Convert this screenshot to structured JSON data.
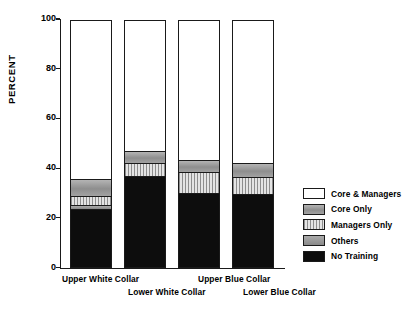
{
  "chart_data": {
    "type": "bar",
    "subtype": "stacked-bar-100-percent",
    "title": "",
    "xlabel": "",
    "ylabel": "PERCENT",
    "ylim": [
      0,
      100
    ],
    "yticks": [
      0,
      20,
      40,
      60,
      80,
      100
    ],
    "ytick_labels": [
      "0",
      "20",
      "40",
      "60",
      "80",
      "100"
    ],
    "grid": false,
    "legend_position": "right",
    "categories": [
      "Upper White Collar",
      "Lower White Collar",
      "Upper Blue Collar",
      "Lower Blue Collar"
    ],
    "series": [
      {
        "name": "No Training",
        "color": "#0d0d0d",
        "pattern": "solid-black",
        "values": [
          23.5,
          37.0,
          30.0,
          29.5
        ]
      },
      {
        "name": "Others",
        "color": "#9c9c9c",
        "pattern": "solid-gray",
        "values": [
          1.5,
          0.0,
          0.0,
          0.0
        ]
      },
      {
        "name": "Managers Only",
        "color": "#bdbdbd",
        "pattern": "vertical-stripes",
        "values": [
          4.0,
          5.0,
          8.5,
          7.0
        ]
      },
      {
        "name": "Core Only",
        "color": "#9c9c9c",
        "pattern": "solid-gray",
        "values": [
          6.5,
          5.0,
          5.0,
          5.5
        ]
      },
      {
        "name": "Core & Managers",
        "color": "#ffffff",
        "pattern": "white",
        "values": [
          64.5,
          53.0,
          56.5,
          58.0
        ]
      }
    ],
    "legend_entries": [
      "Core & Managers",
      "Core Only",
      "Managers Only",
      "Others",
      "No Training"
    ]
  },
  "axes": {
    "y_title": "PERCENT"
  }
}
